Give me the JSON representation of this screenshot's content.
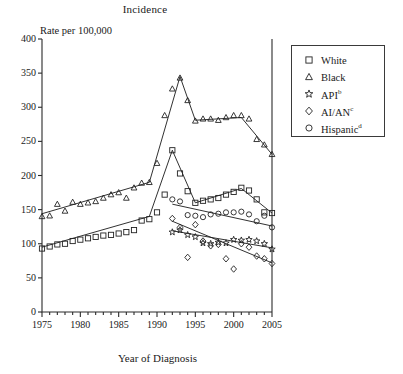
{
  "title": "Incidence",
  "yaxis_label": "Rate per 100,000",
  "xaxis_label": "Year of Diagnosis",
  "legend": {
    "entries": [
      {
        "label": "White",
        "sup": "",
        "marker": "square-marker"
      },
      {
        "label": "Black",
        "sup": "",
        "marker": "triangle-marker"
      },
      {
        "label": "API",
        "sup": "b",
        "marker": "flower-marker"
      },
      {
        "label": "AI/AN",
        "sup": "c",
        "marker": "diamond-marker"
      },
      {
        "label": "Hispanic",
        "sup": "d",
        "marker": "circle-marker"
      }
    ]
  },
  "yticks": [
    "400",
    "350",
    "300",
    "250",
    "200",
    "150",
    "100",
    "50",
    "0"
  ],
  "xticks": [
    "1975",
    "1980",
    "1985",
    "1990",
    "1995",
    "2000",
    "2005"
  ],
  "chart_data": {
    "type": "line",
    "title": "Incidence",
    "xlabel": "Year of Diagnosis",
    "ylabel": "Rate per 100,000",
    "xlim": [
      1975,
      2005
    ],
    "ylim": [
      0,
      400
    ],
    "ytick_step": 50,
    "xtick_step": 5,
    "xminor_step": 1,
    "grid": false,
    "legend_position": "right-outside",
    "annotations": [
      "b",
      "c",
      "d"
    ],
    "series": [
      {
        "name": "White",
        "marker": "square",
        "x": [
          1975,
          1976,
          1977,
          1978,
          1979,
          1980,
          1981,
          1982,
          1983,
          1984,
          1985,
          1986,
          1987,
          1988,
          1989,
          1990,
          1991,
          1992,
          1993,
          1994,
          1995,
          1996,
          1997,
          1998,
          1999,
          2000,
          2001,
          2002,
          2003,
          2004,
          2005
        ],
        "values": [
          93,
          96,
          99,
          100,
          104,
          106,
          108,
          110,
          112,
          113,
          115,
          117,
          120,
          134,
          136,
          146,
          172,
          237,
          203,
          177,
          160,
          163,
          165,
          167,
          172,
          176,
          182,
          178,
          165,
          146,
          145
        ]
      },
      {
        "name": "Black",
        "marker": "triangle",
        "x": [
          1975,
          1976,
          1977,
          1978,
          1979,
          1980,
          1981,
          1982,
          1983,
          1984,
          1985,
          1986,
          1987,
          1988,
          1989,
          1990,
          1991,
          1992,
          1993,
          1994,
          1995,
          1996,
          1997,
          1998,
          1999,
          2000,
          2001,
          2002,
          2003,
          2004,
          2005
        ],
        "values": [
          140,
          141,
          158,
          148,
          161,
          158,
          160,
          162,
          167,
          172,
          175,
          167,
          182,
          189,
          190,
          218,
          288,
          327,
          343,
          310,
          280,
          283,
          283,
          281,
          285,
          288,
          288,
          283,
          253,
          245,
          231
        ]
      },
      {
        "name": "API",
        "marker": "flower",
        "x": [
          1992,
          1993,
          1994,
          1995,
          1996,
          1997,
          1998,
          1999,
          2000,
          2001,
          2002,
          2003,
          2004,
          2005
        ],
        "values": [
          117,
          120,
          113,
          110,
          101,
          100,
          102,
          101,
          106,
          105,
          106,
          104,
          100,
          92
        ]
      },
      {
        "name": "AI/AN",
        "marker": "diamond",
        "x": [
          1992,
          1993,
          1994,
          1995,
          1996,
          1997,
          1998,
          1999,
          2000,
          2001,
          2002,
          2003,
          2004,
          2005
        ],
        "values": [
          137,
          124,
          80,
          128,
          104,
          97,
          99,
          78,
          63,
          100,
          95,
          82,
          78,
          71
        ]
      },
      {
        "name": "Hispanic",
        "marker": "circle",
        "x": [
          1992,
          1993,
          1994,
          1995,
          1996,
          1997,
          1998,
          1999,
          2000,
          2001,
          2002,
          2003,
          2004,
          2005
        ],
        "values": [
          165,
          162,
          142,
          141,
          139,
          143,
          144,
          146,
          146,
          147,
          143,
          133,
          141,
          124
        ]
      }
    ],
    "trend_lines": [
      {
        "name": "White",
        "points": [
          [
            1975,
            95
          ],
          [
            1989,
            140
          ],
          [
            1992,
            237
          ],
          [
            1995,
            160
          ],
          [
            2001,
            181
          ],
          [
            2005,
            145
          ]
        ]
      },
      {
        "name": "Black",
        "points": [
          [
            1975,
            144
          ],
          [
            1989,
            190
          ],
          [
            1993,
            345
          ],
          [
            1995,
            281
          ],
          [
            2001,
            285
          ],
          [
            2005,
            231
          ]
        ]
      },
      {
        "name": "API",
        "points": [
          [
            1992,
            119
          ],
          [
            2005,
            94
          ]
        ]
      },
      {
        "name": "AI/AN",
        "points": [
          [
            1992,
            133
          ],
          [
            2005,
            72
          ]
        ]
      },
      {
        "name": "Hispanic",
        "points": [
          [
            1992,
            158
          ],
          [
            2005,
            126
          ]
        ]
      }
    ]
  }
}
